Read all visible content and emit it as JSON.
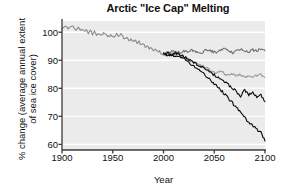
{
  "chart_data": {
    "type": "line",
    "title": "Arctic \"Ice Cap\" Melting",
    "xlabel": "Year",
    "ylabel_line1": "% change (average annual extent",
    "ylabel_line2": "of sea ice cover)",
    "xlim": [
      1900,
      2100
    ],
    "ylim": [
      58,
      104
    ],
    "xticks": [
      1900,
      1950,
      2000,
      2050,
      2100
    ],
    "xtick_labels": [
      "1900",
      "1950",
      "2000",
      "2050",
      "2100"
    ],
    "yticks": [
      60,
      70,
      80,
      90,
      100
    ],
    "ytick_labels": [
      "60",
      "70",
      "80",
      "90",
      "100"
    ],
    "grid": "horizontal-white",
    "legend": "none",
    "plot_background": "#ebebeb",
    "gridline_color": "#ffffff",
    "axis_color": "#3a3a3a",
    "series": [
      {
        "name": "Historical observations",
        "color": "#8a8a8a",
        "x": [
          1900,
          1902,
          1904,
          1906,
          1908,
          1910,
          1912,
          1914,
          1916,
          1918,
          1920,
          1922,
          1924,
          1926,
          1928,
          1930,
          1932,
          1934,
          1936,
          1938,
          1940,
          1942,
          1944,
          1946,
          1948,
          1950,
          1952,
          1954,
          1956,
          1958,
          1960,
          1962,
          1964,
          1966,
          1968,
          1970,
          1972,
          1974,
          1976,
          1978,
          1980,
          1982,
          1984,
          1986,
          1988,
          1990,
          1992,
          1994,
          1996,
          1998,
          2000
        ],
        "values": [
          101.3,
          101.8,
          102.0,
          101.4,
          102.2,
          102.4,
          101.6,
          100.8,
          101.5,
          100.6,
          101.2,
          100.3,
          100.9,
          99.8,
          100.5,
          99.4,
          100.2,
          99.0,
          99.7,
          98.6,
          99.3,
          99.9,
          99.2,
          98.4,
          99.0,
          98.2,
          98.8,
          99.4,
          98.6,
          99.2,
          98.3,
          97.5,
          98.0,
          97.0,
          97.6,
          96.6,
          97.2,
          96.2,
          96.6,
          95.5,
          95.9,
          94.9,
          95.3,
          94.3,
          94.6,
          93.6,
          93.9,
          93.0,
          93.3,
          92.4,
          92.3
        ]
      },
      {
        "name": "Projection A (low emissions)",
        "color": "#707070",
        "x": [
          2000,
          2004,
          2008,
          2012,
          2016,
          2020,
          2024,
          2028,
          2032,
          2036,
          2040,
          2044,
          2048,
          2052,
          2056,
          2060,
          2064,
          2068,
          2072,
          2076,
          2080,
          2084,
          2088,
          2092,
          2096,
          2100
        ],
        "values": [
          92.3,
          92.6,
          92.9,
          93.2,
          92.6,
          93.4,
          92.8,
          93.6,
          93.0,
          92.5,
          93.3,
          93.8,
          93.1,
          92.7,
          93.5,
          93.9,
          93.2,
          92.8,
          93.6,
          94.0,
          93.3,
          92.9,
          93.7,
          93.4,
          93.8,
          93.4
        ]
      },
      {
        "name": "Projection B (medium emissions)",
        "color": "#9a9a9a",
        "x": [
          2000,
          2004,
          2008,
          2012,
          2016,
          2020,
          2024,
          2028,
          2032,
          2036,
          2040,
          2044,
          2048,
          2052,
          2056,
          2060,
          2064,
          2068,
          2072,
          2076,
          2080,
          2084,
          2088,
          2092,
          2096,
          2100
        ],
        "values": [
          92.3,
          92.0,
          92.4,
          91.6,
          91.9,
          91.0,
          90.4,
          89.6,
          89.0,
          88.2,
          87.6,
          86.8,
          86.2,
          85.6,
          86.0,
          85.2,
          84.6,
          85.0,
          84.3,
          84.8,
          84.1,
          84.6,
          83.9,
          84.4,
          84.8,
          83.9
        ]
      },
      {
        "name": "Projection C (high emissions)",
        "color": "#0d0d0d",
        "x": [
          2000,
          2004,
          2008,
          2012,
          2016,
          2020,
          2024,
          2028,
          2032,
          2036,
          2040,
          2044,
          2048,
          2052,
          2056,
          2060,
          2064,
          2068,
          2072,
          2076,
          2080,
          2084,
          2088,
          2092,
          2096,
          2100
        ],
        "values": [
          92.3,
          92.4,
          92.0,
          92.6,
          92.1,
          91.3,
          90.5,
          89.6,
          88.8,
          88.0,
          87.0,
          86.2,
          85.2,
          84.3,
          83.4,
          82.3,
          81.2,
          80.0,
          78.8,
          77.3,
          79.2,
          77.6,
          78.4,
          76.8,
          77.6,
          75.2
        ]
      },
      {
        "name": "Projection D (very high emissions)",
        "color": "#0d0d0d",
        "x": [
          2000,
          2004,
          2008,
          2012,
          2016,
          2020,
          2024,
          2028,
          2032,
          2036,
          2040,
          2044,
          2048,
          2052,
          2056,
          2060,
          2064,
          2068,
          2072,
          2076,
          2080,
          2084,
          2088,
          2092,
          2096,
          2100
        ],
        "values": [
          92.3,
          91.8,
          92.2,
          91.4,
          91.6,
          90.6,
          89.6,
          88.4,
          87.4,
          86.2,
          85.0,
          83.8,
          82.4,
          81.0,
          79.6,
          78.0,
          76.4,
          74.8,
          73.0,
          71.4,
          69.6,
          68.0,
          66.8,
          65.4,
          64.2,
          61.2
        ]
      }
    ]
  }
}
